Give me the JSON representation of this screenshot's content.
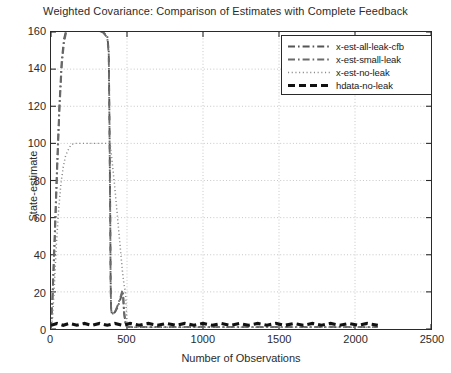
{
  "chart_data": {
    "type": "line",
    "title": "Weighted Covariance: Comparison of Estimates with Complete Feedback",
    "xlabel": "Number of Observations",
    "ylabel": "State-estimate",
    "xlim": [
      0,
      2500
    ],
    "ylim": [
      0,
      160
    ],
    "xticks": [
      0,
      500,
      1000,
      1500,
      2000,
      2500
    ],
    "yticks": [
      0,
      20,
      40,
      60,
      80,
      100,
      120,
      140,
      160
    ],
    "grid": true,
    "legend_position": "upper right",
    "series": [
      {
        "name": "x-est-all-leak-cfb",
        "style": "dash-dot",
        "color": "#555555",
        "x": [
          0,
          10,
          25,
          40,
          55,
          70,
          85,
          100,
          120,
          150,
          200,
          250,
          300,
          340,
          370,
          380,
          385,
          390,
          392,
          395,
          400,
          420,
          440,
          460,
          470,
          475,
          480,
          490,
          500,
          520,
          600,
          800,
          1000,
          1400,
          1800,
          2150
        ],
        "y": [
          0,
          18,
          52,
          88,
          120,
          144,
          156,
          161,
          162,
          161,
          161,
          161,
          161,
          160,
          158,
          150,
          110,
          60,
          30,
          12,
          8,
          9,
          12,
          17,
          20,
          18,
          10,
          3,
          1,
          1,
          1,
          1,
          1,
          1,
          1,
          1
        ]
      },
      {
        "name": "x-est-small-leak",
        "style": "dash-dot",
        "color": "#6a6a6a",
        "x": [
          0,
          10,
          25,
          40,
          55,
          70,
          85,
          100,
          120,
          150,
          200,
          250,
          300,
          340,
          370,
          380,
          385,
          390,
          392,
          395,
          400,
          420,
          440,
          460,
          470,
          475,
          480,
          490,
          500,
          520,
          600,
          800,
          1000,
          1400,
          1800,
          2150
        ],
        "y": [
          0,
          16,
          48,
          84,
          117,
          141,
          154,
          160,
          161,
          161,
          161,
          161,
          161,
          160,
          157,
          148,
          105,
          55,
          26,
          11,
          8,
          9,
          13,
          18,
          21,
          17,
          9,
          3,
          1,
          1,
          1,
          1,
          1,
          1,
          1,
          1
        ]
      },
      {
        "name": "x-est-no-leak",
        "style": "dotted",
        "color": "#8a8a8a",
        "x": [
          0,
          10,
          20,
          35,
          50,
          65,
          80,
          95,
          110,
          130,
          150,
          200,
          250,
          300,
          340,
          370,
          385,
          390,
          400,
          410,
          420,
          430,
          440,
          450,
          460,
          470,
          480,
          490,
          500,
          520,
          600,
          800,
          1000,
          1400,
          1800,
          2150
        ],
        "y": [
          0,
          6,
          20,
          45,
          64,
          78,
          87,
          93,
          96,
          99,
          100,
          100,
          100,
          100,
          100,
          100,
          100,
          99,
          92,
          84,
          76,
          67,
          58,
          49,
          40,
          31,
          24,
          20,
          2,
          1,
          1,
          1,
          1,
          1,
          1,
          1
        ]
      },
      {
        "name": "hdata-no-leak",
        "style": "thick-dashed",
        "color": "#111111",
        "x": [
          0,
          40,
          80,
          120,
          170,
          220,
          270,
          320,
          370,
          420,
          470,
          520,
          580,
          640,
          700,
          760,
          820,
          880,
          940,
          1000,
          1060,
          1120,
          1180,
          1240,
          1300,
          1360,
          1420,
          1480,
          1540,
          1600,
          1660,
          1720,
          1780,
          1840,
          1900,
          1960,
          2020,
          2080,
          2150
        ],
        "y": [
          2,
          3,
          2,
          3,
          2,
          3,
          2,
          3,
          2,
          3,
          2,
          3,
          2,
          3,
          2,
          3,
          2,
          3,
          2,
          3,
          2,
          3,
          2,
          3,
          2,
          3,
          2,
          3,
          2,
          3,
          2,
          3,
          2,
          3,
          2,
          3,
          2,
          3,
          2
        ]
      }
    ]
  },
  "legend": {
    "entries": [
      {
        "label": "x-est-all-leak-cfb",
        "style": "dash-dot"
      },
      {
        "label": "x-est-small-leak",
        "style": "dash-dot"
      },
      {
        "label": "x-est-no-leak",
        "style": "dotted"
      },
      {
        "label": "hdata-no-leak",
        "style": "thick-dashed"
      }
    ]
  },
  "colors": {
    "axis": "#2a2a2a",
    "grid": "#b8b8b8",
    "text": "#2b2b2b"
  }
}
